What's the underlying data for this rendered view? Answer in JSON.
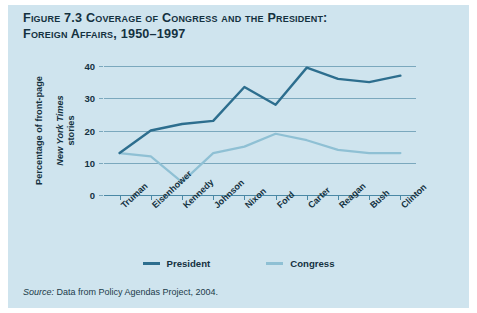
{
  "figure": {
    "label": "Figure 7.3",
    "title_line_1": "Figure 7.3 Coverage of Congress and the President:",
    "title_line_2": "Foreign Affairs, 1950–1997",
    "source_prefix": "Source:",
    "source_text": " Data from Policy Agendas Project, 2004."
  },
  "colors": {
    "panel_background": "#cfe4ee",
    "page_background": "#ffffff",
    "president_line": "#2d6e8e",
    "congress_line": "#8fc0d4",
    "gridline": "#7ba8bd",
    "axis": "#4a88a5",
    "text": "#14313f"
  },
  "chart_data": {
    "type": "line",
    "title": "Figure 7.3 Coverage of Congress and the President: Foreign Affairs, 1950–1997",
    "xlabel": "",
    "ylabel": "Percentage of front-page New York Times stories",
    "ylabel_part_1": "Percentage of front-page",
    "ylabel_part_2": "New York Times",
    "ylabel_part_3": " stories",
    "categories": [
      "Truman",
      "Eisenhower",
      "Kennedy",
      "Johnson",
      "Nixon",
      "Ford",
      "Carter",
      "Reagan",
      "Bush",
      "Clinton"
    ],
    "ylim": [
      0,
      40
    ],
    "yticks": [
      0,
      10,
      20,
      30,
      40
    ],
    "ytick_labels": [
      "0",
      "10",
      "20",
      "30",
      "40"
    ],
    "grid": true,
    "legend_position": "bottom",
    "series": [
      {
        "name": "President",
        "color": "#2d6e8e",
        "values": [
          13,
          20,
          22,
          23,
          33.5,
          28,
          39.5,
          36,
          35,
          37
        ]
      },
      {
        "name": "Congress",
        "color": "#8fc0d4",
        "values": [
          13,
          12,
          4,
          13,
          15,
          19,
          17,
          14,
          13,
          13
        ]
      }
    ]
  }
}
